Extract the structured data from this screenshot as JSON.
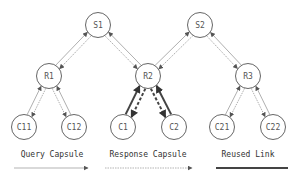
{
  "diagram": {
    "type": "tree-network",
    "nodes": [
      {
        "id": "S1",
        "label": "S1",
        "level": "server"
      },
      {
        "id": "S2",
        "label": "S2",
        "level": "server"
      },
      {
        "id": "R1",
        "label": "R1",
        "level": "router"
      },
      {
        "id": "R2",
        "label": "R2",
        "level": "router"
      },
      {
        "id": "R3",
        "label": "R3",
        "level": "router"
      },
      {
        "id": "C11",
        "label": "C11",
        "level": "client"
      },
      {
        "id": "C12",
        "label": "C12",
        "level": "client"
      },
      {
        "id": "C1",
        "label": "C1",
        "level": "client"
      },
      {
        "id": "C2",
        "label": "C2",
        "level": "client"
      },
      {
        "id": "C21",
        "label": "C21",
        "level": "client"
      },
      {
        "id": "C22",
        "label": "C22",
        "level": "client"
      }
    ],
    "edges": [
      {
        "a": "S1",
        "b": "R1",
        "style": "normal"
      },
      {
        "a": "S1",
        "b": "R2",
        "style": "normal"
      },
      {
        "a": "S2",
        "b": "R2",
        "style": "normal"
      },
      {
        "a": "S2",
        "b": "R3",
        "style": "normal"
      },
      {
        "a": "R1",
        "b": "C11",
        "style": "normal"
      },
      {
        "a": "R1",
        "b": "C12",
        "style": "normal"
      },
      {
        "a": "R2",
        "b": "C1",
        "style": "reused"
      },
      {
        "a": "R2",
        "b": "C2",
        "style": "reused"
      },
      {
        "a": "R3",
        "b": "C21",
        "style": "normal"
      },
      {
        "a": "R3",
        "b": "C22",
        "style": "normal"
      }
    ]
  },
  "legend": {
    "items": [
      {
        "label": "Query Capsule",
        "kind": "query"
      },
      {
        "label": "Response Capsule",
        "kind": "response"
      },
      {
        "label": "Reused Link",
        "kind": "reused"
      }
    ]
  },
  "colors": {
    "normal_line": "#9a9a9a",
    "reused_line": "#444444",
    "node_stroke": "#555555"
  }
}
